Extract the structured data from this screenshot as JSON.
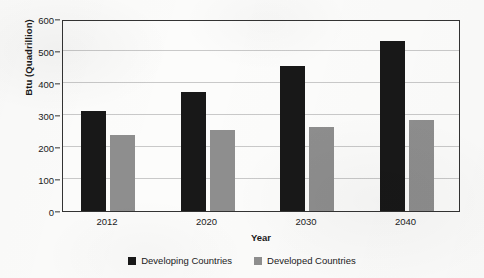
{
  "chart_data": {
    "type": "bar",
    "title": "",
    "subtitle": "",
    "xlabel": "Year",
    "ylabel": "Btu (Quadrillion)",
    "categories": [
      "2012",
      "2020",
      "2030",
      "2040"
    ],
    "series": [
      {
        "name": "Developing Countries",
        "color": "#181818",
        "values": [
          311,
          373,
          452,
          531
        ]
      },
      {
        "name": "Developed Countries",
        "color": "#8e8e8e",
        "values": [
          236,
          253,
          264,
          283
        ]
      }
    ],
    "ylim": [
      0,
      600
    ],
    "ytick_labels": [
      "0",
      "100",
      "200",
      "300",
      "400",
      "500",
      "600"
    ],
    "ytick_values": [
      0,
      100,
      200,
      300,
      400,
      500,
      600
    ],
    "grid": true,
    "legend_position": "bottom"
  }
}
